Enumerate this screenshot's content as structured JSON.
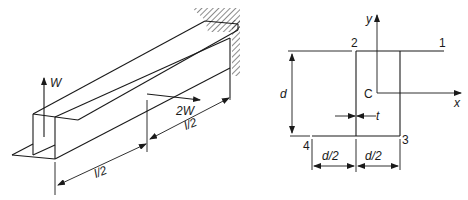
{
  "figure": {
    "left_view": {
      "description": "Thin-walled cantilever beam (Z-section) fixed at far end",
      "loads": [
        {
          "label": "W",
          "direction": "up",
          "position": "free end"
        },
        {
          "label": "2W",
          "direction": "horizontal",
          "position": "mid-span"
        }
      ],
      "dimensions": [
        {
          "label": "l/2",
          "segment": "free end to mid-span"
        },
        {
          "label": "l/2",
          "segment": "mid-span to support"
        }
      ],
      "support": "fixed wall (hatched)"
    },
    "right_view": {
      "description": "Cross-section of Z-section beam",
      "points": [
        "1",
        "2",
        "3",
        "4"
      ],
      "centroid": "C",
      "axes": {
        "x": "x",
        "y": "y"
      },
      "dimensions": {
        "depth": "d",
        "thickness": "t",
        "half_width_left": "d/2",
        "half_width_right": "d/2"
      }
    }
  },
  "colors": {
    "ink": "#1a1a1a",
    "background": "#ffffff"
  }
}
